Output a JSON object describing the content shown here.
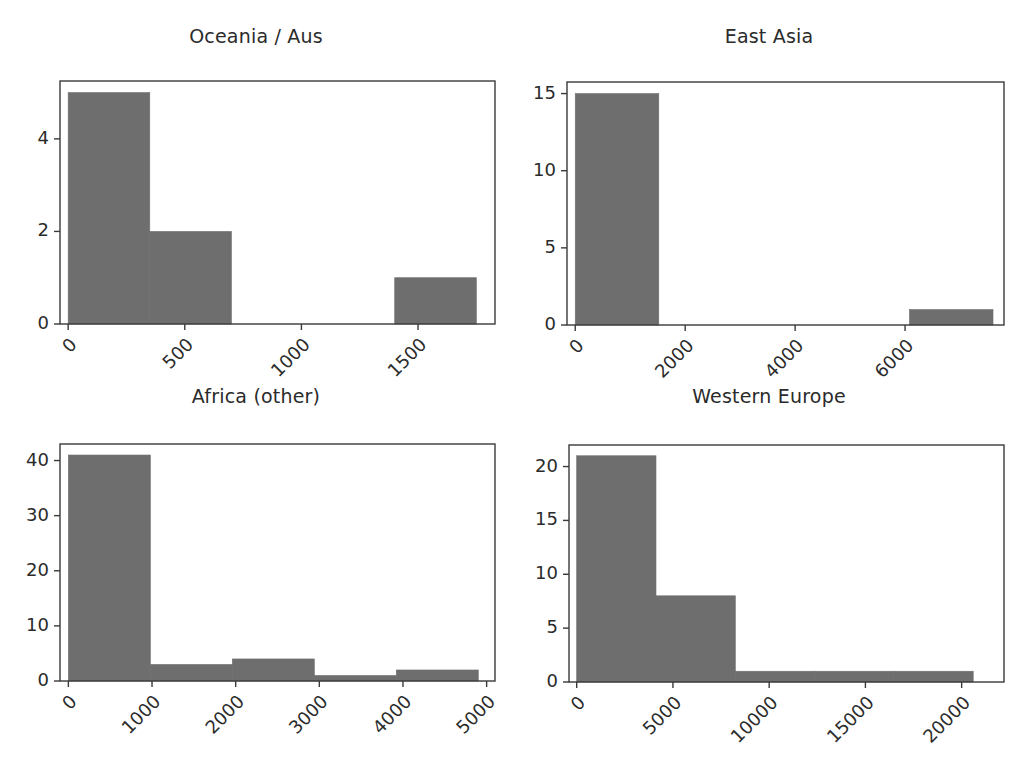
{
  "figure": {
    "width": 1025,
    "height": 765,
    "background": "#ffffff",
    "bar_color": "#6e6e6e",
    "axis_color": "#3a3a3a",
    "text_color": "#2b2b2b",
    "cropped_top_titles": [
      "g",
      "y g"
    ]
  },
  "chart_data": [
    {
      "type": "bar",
      "subplot": "top-left",
      "title": "Oceania / Aus",
      "xlabel": "",
      "ylabel": "",
      "grid": false,
      "legend": null,
      "xlim": [
        -35,
        1830
      ],
      "ylim": [
        0,
        5.25
      ],
      "xticks": [
        0,
        500,
        1000,
        1500
      ],
      "xticklabels": [
        "0",
        "500",
        "1000",
        "1500"
      ],
      "yticks": [
        0,
        2,
        4
      ],
      "yticklabels": [
        "0",
        "2",
        "4"
      ],
      "bin_edges": [
        0,
        350,
        700,
        1050,
        1400,
        1750
      ],
      "values": [
        5,
        2,
        0,
        0,
        1
      ],
      "categories": [
        "0-350",
        "350-700",
        "700-1050",
        "1050-1400",
        "1400-1750"
      ]
    },
    {
      "type": "bar",
      "subplot": "top-right",
      "title": "East Asia",
      "xlabel": "",
      "ylabel": "",
      "grid": false,
      "legend": null,
      "xlim": [
        -150,
        7800
      ],
      "ylim": [
        0,
        15.75
      ],
      "xticks": [
        0,
        2000,
        4000,
        6000,
        8000
      ],
      "xticklabels": [
        "0",
        "2000",
        "4000",
        "6000",
        "8000"
      ],
      "yticks": [
        0,
        5,
        10,
        15
      ],
      "yticklabels": [
        "0",
        "5",
        "10",
        "15"
      ],
      "bin_edges": [
        0,
        1520,
        3040,
        4560,
        6080,
        7600
      ],
      "values": [
        15,
        0,
        0,
        0,
        1
      ],
      "categories": [
        "0-1520",
        "1520-3040",
        "3040-4560",
        "4560-6080",
        "6080-7600"
      ]
    },
    {
      "type": "bar",
      "subplot": "bottom-left",
      "title": "Africa (other)",
      "xlabel": "",
      "ylabel": "",
      "grid": false,
      "legend": null,
      "xlim": [
        -100,
        5100
      ],
      "ylim": [
        0,
        43
      ],
      "xticks": [
        0,
        1000,
        2000,
        3000,
        4000,
        5000
      ],
      "xticklabels": [
        "0",
        "1000",
        "2000",
        "3000",
        "4000",
        "5000"
      ],
      "yticks": [
        0,
        10,
        20,
        30,
        40
      ],
      "yticklabels": [
        "0",
        "10",
        "20",
        "30",
        "40"
      ],
      "bin_edges": [
        0,
        980,
        1960,
        2940,
        3920,
        4900
      ],
      "values": [
        41,
        3,
        4,
        1,
        2
      ],
      "categories": [
        "0-980",
        "980-1960",
        "1960-2940",
        "2940-3920",
        "3920-4900"
      ]
    },
    {
      "type": "bar",
      "subplot": "bottom-right",
      "title": "Western Europe",
      "xlabel": "",
      "ylabel": "",
      "grid": false,
      "legend": null,
      "xlim": [
        -400,
        22200
      ],
      "ylim": [
        0,
        22
      ],
      "xticks": [
        0,
        5000,
        10000,
        15000,
        20000
      ],
      "xticklabels": [
        "0",
        "5000",
        "10000",
        "15000",
        "20000"
      ],
      "yticks": [
        0,
        5,
        10,
        15,
        20
      ],
      "yticklabels": [
        "0",
        "5",
        "10",
        "15",
        "20"
      ],
      "bin_edges": [
        0,
        4120,
        8240,
        12360,
        16480,
        20600
      ],
      "values": [
        21,
        8,
        1,
        1,
        1
      ],
      "categories": [
        "0-4120",
        "4120-8240",
        "8240-12360",
        "12360-16480",
        "16480-20600"
      ]
    }
  ]
}
